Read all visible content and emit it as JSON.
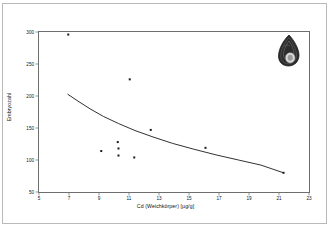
{
  "figure": {
    "background_color": "#ffffff",
    "frame_color": "#6e6e6e",
    "border_color": "#b9b9b9",
    "marker_color": "#1a1a1a",
    "line_color": "#1a1a1a"
  },
  "decoration": {
    "shell_label": "snail-shell-illustration",
    "shell_body_color": "#2b2b2b",
    "shell_aperture_color": "#d8d8d8"
  },
  "chart_data": {
    "type": "scatter",
    "title": "",
    "xlabel": "Cd (Weichkörper) [µg/g]",
    "ylabel": "Embryozahl",
    "xlim": [
      5,
      23
    ],
    "ylim": [
      50,
      300
    ],
    "xticks": [
      5,
      7,
      9,
      11,
      13,
      15,
      17,
      19,
      21,
      23
    ],
    "xtick_labels": [
      "5",
      "7",
      "9",
      "11",
      "13",
      "15",
      "17",
      "19",
      "21",
      "23"
    ],
    "yticks": [
      50,
      100,
      150,
      200,
      250,
      300
    ],
    "ytick_labels": [
      "50",
      "100",
      "150",
      "200",
      "250",
      "300"
    ],
    "grid": false,
    "legend": false,
    "series": [
      {
        "name": "Messpunkte",
        "type": "scatter",
        "marker": "square",
        "points": [
          {
            "x": 6.95,
            "y": 296
          },
          {
            "x": 11.05,
            "y": 226
          },
          {
            "x": 12.45,
            "y": 147
          },
          {
            "x": 10.25,
            "y": 128
          },
          {
            "x": 10.3,
            "y": 118
          },
          {
            "x": 16.1,
            "y": 119
          },
          {
            "x": 9.15,
            "y": 114
          },
          {
            "x": 10.3,
            "y": 107
          },
          {
            "x": 11.35,
            "y": 104
          },
          {
            "x": 21.3,
            "y": 80
          }
        ]
      },
      {
        "name": "Regressionskurve",
        "type": "line",
        "points": [
          {
            "x": 6.9,
            "y": 203
          },
          {
            "x": 7.6,
            "y": 192
          },
          {
            "x": 8.4,
            "y": 180
          },
          {
            "x": 9.3,
            "y": 168
          },
          {
            "x": 10.3,
            "y": 157
          },
          {
            "x": 11.4,
            "y": 146
          },
          {
            "x": 12.6,
            "y": 136
          },
          {
            "x": 13.9,
            "y": 126
          },
          {
            "x": 15.3,
            "y": 117
          },
          {
            "x": 16.8,
            "y": 108
          },
          {
            "x": 18.3,
            "y": 100
          },
          {
            "x": 19.8,
            "y": 92
          },
          {
            "x": 21.3,
            "y": 80
          }
        ]
      }
    ]
  }
}
